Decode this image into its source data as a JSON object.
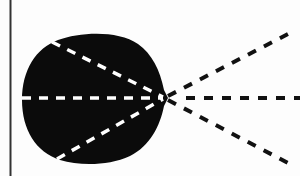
{
  "figure": {
    "description": "Black rounded blob with three white dashed rays inside converging at a point, continuing as three black dashed rays to the right",
    "colors": {
      "background": "#fdfdfd",
      "border": "#333333",
      "blob": "#0b0b0b",
      "inner_dashes": "#ffffff",
      "outer_dashes": "#111111"
    },
    "convergence_point": [
      165,
      98
    ],
    "inner_rays": [
      {
        "name": "upper",
        "from": [
          52,
          42
        ],
        "to": [
          163,
          97
        ]
      },
      {
        "name": "middle",
        "from": [
          22,
          98
        ],
        "to": [
          163,
          98
        ]
      },
      {
        "name": "lower",
        "from": [
          55,
          160
        ],
        "to": [
          163,
          99
        ]
      }
    ],
    "outer_rays": [
      {
        "name": "upper",
        "from": [
          168,
          96
        ],
        "to": [
          288,
          34
        ]
      },
      {
        "name": "middle",
        "from": [
          172,
          98
        ],
        "to": [
          300,
          98
        ]
      },
      {
        "name": "lower",
        "from": [
          168,
          100
        ],
        "to": [
          288,
          163
        ]
      }
    ]
  }
}
